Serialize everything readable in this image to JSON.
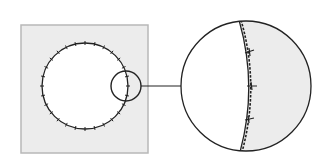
{
  "diagram": {
    "title": "Circular wound with sutures and magnified detail",
    "colors": {
      "background": "#ffffff",
      "tissue_fill": "#ececec",
      "square_border": "#b8b8b8",
      "line": "#222222",
      "wound_fill": "#ffffff"
    },
    "overview_panel": {
      "square": {
        "x": 21,
        "y": 25,
        "width": 127,
        "height": 128
      },
      "wound_circle": {
        "cx": 85,
        "cy": 86,
        "r": 43,
        "tick_count": 28
      },
      "magnifier_circle": {
        "cx": 126,
        "cy": 86,
        "r": 15
      }
    },
    "connector": {
      "x1": 141,
      "y1": 86,
      "x2": 181,
      "y2": 86
    },
    "detail_panel": {
      "circle": {
        "cx": 246,
        "cy": 86,
        "r": 65
      },
      "edge_curve_label": "wound edge (dashed suture line)",
      "suture_marks": [
        {
          "y": 52
        },
        {
          "y": 86
        },
        {
          "y": 120
        }
      ]
    }
  }
}
